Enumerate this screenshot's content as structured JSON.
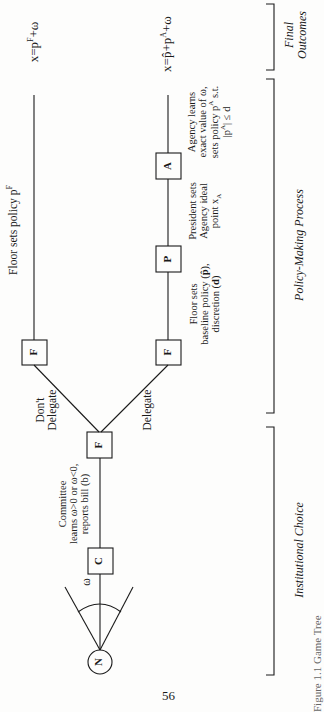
{
  "figure": {
    "nodes": {
      "nature": "N",
      "committee": "C",
      "floor_trunk": "F",
      "floor_top": "F",
      "floor_bottom": "F",
      "president": "P",
      "agency": "A"
    },
    "edge_labels": {
      "omega": "ω",
      "dont_delegate_line1": "Don't",
      "dont_delegate_line2": "Delegate",
      "delegate": "Delegate"
    },
    "annotations": {
      "committee": [
        "Committee",
        "learns ω>0 or ω<0,",
        "reports bill (b)"
      ],
      "floor_top": "Floor sets policy pF",
      "floor_bottom": [
        "Floor sets",
        "baseline policy (p̂),",
        "discretion (d)"
      ],
      "president": [
        "President sets",
        "Agency ideal",
        "point xA"
      ],
      "agency": [
        "Agency learns",
        "exact value of ω,",
        "sets policy pA s.t.",
        "|pA| ≤ d"
      ]
    },
    "outcomes": {
      "top": "x=pF+ω",
      "bottom": "x=p̂+pA+ω"
    },
    "stages": {
      "final": [
        "Final",
        "Outcomes"
      ],
      "policy": "Policy-Making Process",
      "institutional": "Institutional Choice"
    },
    "caption": "Figure 1.1  Game Tree"
  },
  "page_number": "56"
}
